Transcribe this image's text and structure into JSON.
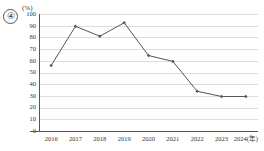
{
  "figure": {
    "index_label": "④",
    "unit_label": "(%)",
    "background_color": "#ffffff",
    "series_color": "#555555",
    "gridline_color": "#dddddd",
    "axis_color": "#555555"
  },
  "chart_data": {
    "type": "line",
    "title": "",
    "subtitle": "",
    "xlabel": "",
    "ylabel": "(%)",
    "categories": [
      "2016",
      "2017",
      "2018",
      "2019",
      "2020",
      "2021",
      "2022",
      "2023",
      "2024(年)"
    ],
    "x_tick_labels": [
      "2016",
      "2017",
      "2018",
      "2019",
      "2020",
      "2021",
      "2022",
      "2023",
      "2024(年)"
    ],
    "y_tick_labels": [
      "0",
      "10",
      "20",
      "30",
      "40",
      "50",
      "60",
      "70",
      "80",
      "90",
      "100"
    ],
    "y_ticks": [
      0,
      10,
      20,
      30,
      40,
      50,
      60,
      70,
      80,
      90,
      100
    ],
    "ylim": [
      0,
      100
    ],
    "values": [
      56,
      89.5,
      81,
      92.5,
      64.5,
      59.5,
      34,
      29.5,
      29.5
    ],
    "series": [
      {
        "name": "",
        "values": [
          56,
          89.5,
          81,
          92.5,
          64.5,
          59.5,
          34,
          29.5,
          29.5
        ],
        "color": "#555555",
        "marker": "diamond"
      }
    ],
    "grid": true,
    "grid_axis": "y",
    "legend": false,
    "legend_position": "none"
  }
}
